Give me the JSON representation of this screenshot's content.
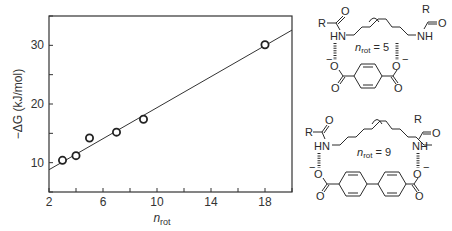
{
  "chart_data": {
    "type": "scatter",
    "title": "",
    "xlabel": "n_rot",
    "ylabel": "−ΔG (kJ/mol)",
    "xlim": [
      2,
      20
    ],
    "ylim": [
      5,
      35
    ],
    "x_ticks": [
      2,
      6,
      10,
      14,
      18
    ],
    "x_minor_ticks": [
      4,
      8,
      12,
      16,
      20
    ],
    "y_ticks": [
      10,
      20,
      30
    ],
    "y_minor_ticks": [
      5,
      15,
      25,
      35
    ],
    "grid": false,
    "legend": null,
    "series": [
      {
        "name": "measured",
        "marker": "open-circle",
        "x": [
          3,
          4,
          5,
          7,
          9,
          18
        ],
        "y": [
          10.4,
          11.2,
          14.2,
          15.2,
          17.4,
          30.1
        ]
      }
    ],
    "fit_line": {
      "x": [
        2,
        20
      ],
      "y": [
        8.8,
        32.6
      ]
    }
  },
  "axes": {
    "x_label_main": "n",
    "x_label_sub": "rot",
    "y_label": "−ΔG (kJ/mol)",
    "x_tick_labels": [
      "2",
      "6",
      "10",
      "14",
      "18"
    ],
    "y_tick_labels": [
      "10",
      "20",
      "30"
    ]
  },
  "structures": [
    {
      "label_main": "n",
      "label_sub": "rot",
      "label_value": " = 5",
      "r_left": "R",
      "r_right": "R",
      "o_left": "O",
      "o_right": "O",
      "nh_left": "HN",
      "nh_right": "NH",
      "carboxylate_o_left": "O",
      "carboxylate_o_right": "O",
      "carbonyl_o_left": "O",
      "carbonyl_o_right": "O",
      "charge": "−"
    },
    {
      "label_main": "n",
      "label_sub": "rot",
      "label_value": " = 9",
      "r_left": "R",
      "r_right": "R",
      "o_left": "O",
      "o_right": "O",
      "nh_left": "HN",
      "nh_right": "NH",
      "carboxylate_o_left": "O",
      "carboxylate_o_right": "O",
      "carbonyl_o_left": "O",
      "carbonyl_o_right": "O",
      "charge": "−"
    }
  ]
}
